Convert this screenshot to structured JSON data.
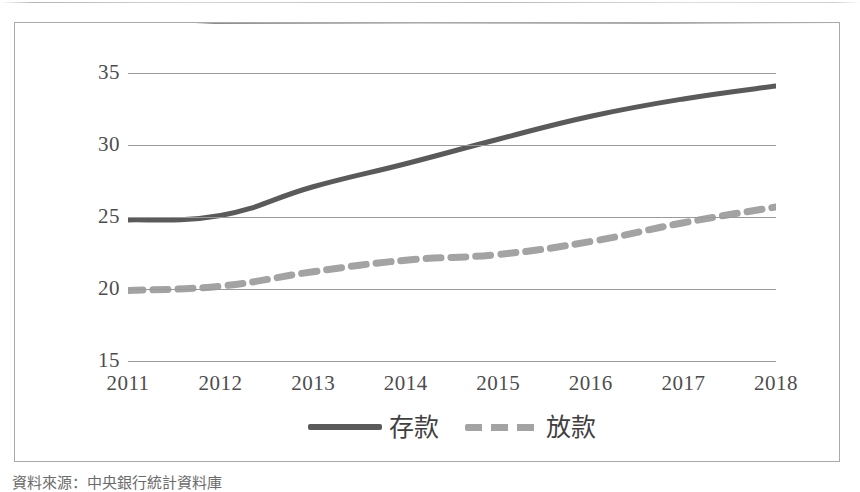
{
  "figure": {
    "source_caption": "資料來源：中央銀行統計資料庫"
  },
  "chart_data": {
    "type": "line",
    "title": "",
    "xlabel": "",
    "ylabel": "",
    "categories": [
      "2011",
      "2012",
      "2013",
      "2014",
      "2015",
      "2016",
      "2017",
      "2018"
    ],
    "x_tick_labels": [
      "2011",
      "2012",
      "2013",
      "2014",
      "2015",
      "2016",
      "2017",
      "2018"
    ],
    "y_tick_labels": [
      "35",
      "30",
      "25",
      "20",
      "15"
    ],
    "y_ticks": [
      35,
      30,
      25,
      20,
      15
    ],
    "ylim": [
      15,
      35
    ],
    "grid": "horizontal",
    "legend_position": "bottom",
    "series": [
      {
        "name": "存款",
        "style": "solid",
        "color": "#5a5a5a",
        "values": [
          24.8,
          25.1,
          27.1,
          28.7,
          30.4,
          32.0,
          33.2,
          34.1
        ]
      },
      {
        "name": "放款",
        "style": "dashed",
        "color": "#a3a3a3",
        "values": [
          19.9,
          20.2,
          21.2,
          22.0,
          22.4,
          23.3,
          24.6,
          25.7
        ]
      }
    ]
  },
  "colors": {
    "deposit_line": "#5a5a5a",
    "loan_line": "#a3a3a3",
    "gridline": "#9a9a9a",
    "frame_border": "#a9a9a9",
    "tick_text": "#4d4d4d"
  }
}
